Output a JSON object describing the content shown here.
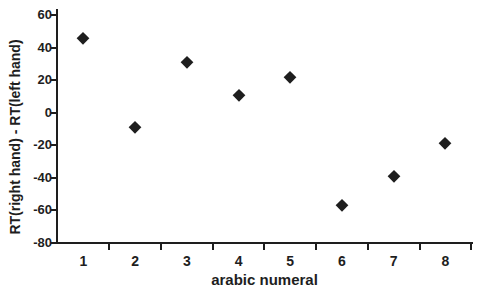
{
  "figure": {
    "background_color": "#ffffff",
    "axis_color": "#1e1e1e",
    "text_color": "#1e1e1e"
  },
  "chart_data": {
    "type": "scatter",
    "title": "",
    "xlabel": "arabic numeral",
    "ylabel": "RT(right hand) - RT(left hand)",
    "x": [
      1,
      2,
      3,
      4,
      5,
      6,
      7,
      8
    ],
    "values": [
      46,
      -9,
      31,
      11,
      22,
      -57,
      -39,
      -19
    ],
    "x_tick_labels": [
      "1",
      "2",
      "3",
      "4",
      "5",
      "6",
      "7",
      "8"
    ],
    "y_ticks": [
      60,
      40,
      20,
      0,
      -20,
      -40,
      -60,
      -80
    ],
    "ylim": [
      -80,
      60
    ],
    "grid": false,
    "legend_position": "none",
    "marker": "diamond",
    "marker_color": "#1e1e1e"
  }
}
